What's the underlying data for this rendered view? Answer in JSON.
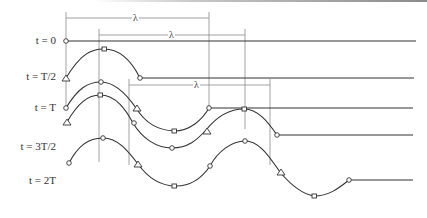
{
  "diagram": {
    "wavelength_symbol": "λ",
    "rows": [
      {
        "label": "t = 0",
        "y": 41
      },
      {
        "label": "t = T/2",
        "y": 78
      },
      {
        "label": "t = T",
        "y": 108
      },
      {
        "label": "t = 3T/2",
        "y": 148
      },
      {
        "label": "t = 2T",
        "y": 181
      }
    ],
    "wavelength_markers": [
      {
        "label": "λ",
        "y": 18,
        "x1": 66,
        "x2": 209
      },
      {
        "label": "λ",
        "y": 35,
        "x1": 99,
        "x2": 245
      },
      {
        "label": "λ",
        "y": 85,
        "x1": 129,
        "x2": 270
      }
    ],
    "markers_legend": [
      "circle",
      "square",
      "triangle"
    ],
    "colors": {
      "line": "#333333",
      "guide": "#888888",
      "background": "#ffffff"
    }
  }
}
